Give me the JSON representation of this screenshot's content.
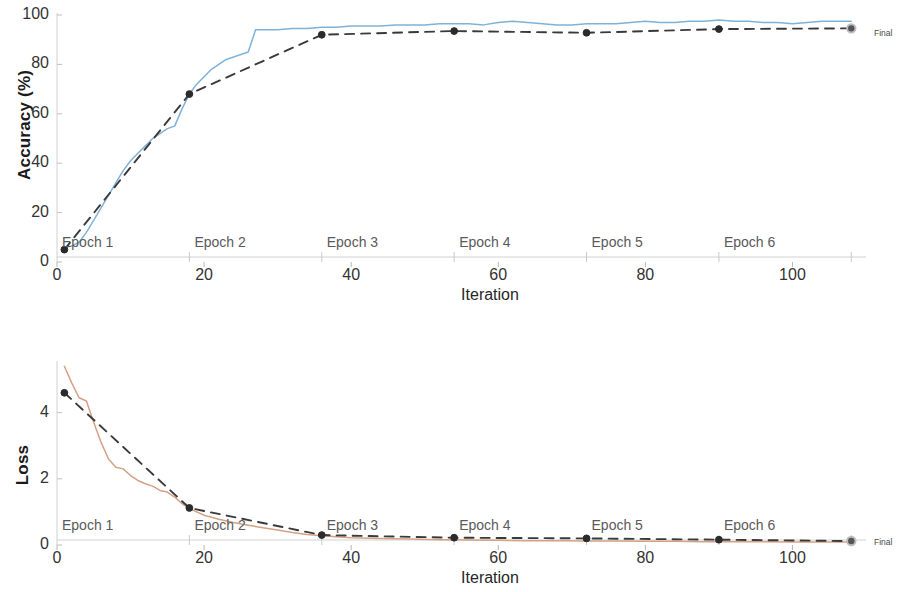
{
  "figure": {
    "background_color": "#ffffff",
    "final_label": "Final"
  },
  "accuracy_panel": {
    "name": "accuracy-plot",
    "ylabel": "Accuracy (%)",
    "xlabel": "Iteration",
    "yticks": [
      "0",
      "20",
      "40",
      "60",
      "80",
      "100"
    ],
    "xticks": [
      "0",
      "20",
      "40",
      "60",
      "80",
      "100"
    ],
    "epochs": [
      "Epoch 1",
      "Epoch 2",
      "Epoch 3",
      "Epoch 4",
      "Epoch 5",
      "Epoch 6"
    ]
  },
  "loss_panel": {
    "name": "loss-plot",
    "ylabel": "Loss",
    "xlabel": "Iteration",
    "yticks": [
      "0",
      "2",
      "4"
    ],
    "xticks": [
      "0",
      "20",
      "40",
      "60",
      "80",
      "100"
    ],
    "epochs": [
      "Epoch 1",
      "Epoch 2",
      "Epoch 3",
      "Epoch 4",
      "Epoch 5",
      "Epoch 6"
    ]
  },
  "chart_data": [
    {
      "type": "line",
      "title": "",
      "xlabel": "Iteration",
      "ylabel": "Accuracy (%)",
      "xlim": [
        0,
        110
      ],
      "ylim": [
        0,
        100
      ],
      "xticks": [
        0,
        20,
        40,
        60,
        80,
        100
      ],
      "yticks": [
        0,
        20,
        40,
        60,
        80,
        100
      ],
      "grid": false,
      "legend": false,
      "epoch_boundaries": [
        18,
        36,
        54,
        72,
        90,
        108
      ],
      "epoch_labels": [
        "Epoch 1",
        "Epoch 2",
        "Epoch 3",
        "Epoch 4",
        "Epoch 5",
        "Epoch 6"
      ],
      "series": [
        {
          "name": "Training accuracy",
          "color": "#7FB2D9",
          "style": "solid",
          "x": [
            1,
            2,
            3,
            4,
            5,
            6,
            7,
            8,
            9,
            10,
            11,
            12,
            13,
            14,
            15,
            16,
            17,
            18,
            19,
            20,
            21,
            22,
            23,
            24,
            25,
            26,
            27,
            28,
            29,
            30,
            32,
            34,
            36,
            38,
            40,
            42,
            44,
            46,
            48,
            50,
            52,
            54,
            56,
            58,
            60,
            62,
            64,
            66,
            68,
            70,
            72,
            74,
            76,
            78,
            80,
            82,
            84,
            86,
            88,
            90,
            92,
            94,
            96,
            98,
            100,
            102,
            104,
            106,
            108
          ],
          "y": [
            6,
            6.5,
            8,
            12,
            17,
            22,
            27,
            32,
            37,
            41,
            44,
            47,
            50,
            52,
            54,
            55,
            62,
            68,
            72,
            75,
            78,
            80,
            82,
            83,
            84,
            85,
            94,
            94,
            94,
            94,
            94.5,
            94.5,
            95,
            95,
            95.5,
            95.5,
            95.5,
            96,
            96,
            96,
            96.5,
            96.5,
            96.5,
            96,
            97,
            97.5,
            97,
            96.5,
            96,
            96,
            96.5,
            96.5,
            96.5,
            97,
            97.5,
            97,
            97,
            97.5,
            97.5,
            98,
            97.5,
            97.5,
            97,
            97,
            96.5,
            97,
            97.5,
            97.5,
            97.5
          ]
        },
        {
          "name": "Validation accuracy",
          "color": "#3A3A3A",
          "style": "dashed",
          "x": [
            1,
            18,
            36,
            54,
            72,
            90,
            108
          ],
          "y": [
            5,
            68,
            92,
            93.5,
            92.8,
            94.3,
            94.6
          ]
        }
      ],
      "markers": [
        {
          "x": 1,
          "y": 5
        },
        {
          "x": 18,
          "y": 68
        },
        {
          "x": 36,
          "y": 92
        },
        {
          "x": 54,
          "y": 93.5
        },
        {
          "x": 72,
          "y": 92.8
        },
        {
          "x": 90,
          "y": 94.3
        },
        {
          "x": 108,
          "y": 94.6
        }
      ],
      "final_marker": {
        "x": 108,
        "y": 94.6,
        "label": "Final"
      }
    },
    {
      "type": "line",
      "title": "",
      "xlabel": "Iteration",
      "ylabel": "Loss",
      "xlim": [
        0,
        110
      ],
      "ylim": [
        0,
        5.5
      ],
      "xticks": [
        0,
        20,
        40,
        60,
        80,
        100
      ],
      "yticks": [
        0,
        2,
        4
      ],
      "grid": false,
      "legend": false,
      "epoch_boundaries": [
        18,
        36,
        54,
        72,
        90,
        108
      ],
      "epoch_labels": [
        "Epoch 1",
        "Epoch 2",
        "Epoch 3",
        "Epoch 4",
        "Epoch 5",
        "Epoch 6"
      ],
      "series": [
        {
          "name": "Training loss",
          "color": "#D5A184",
          "style": "solid",
          "x": [
            1,
            2,
            3,
            4,
            5,
            6,
            7,
            8,
            9,
            10,
            11,
            12,
            13,
            14,
            15,
            16,
            17,
            18,
            19,
            20,
            22,
            24,
            26,
            28,
            30,
            32,
            34,
            36,
            38,
            40,
            44,
            48,
            52,
            56,
            60,
            64,
            68,
            72,
            76,
            80,
            84,
            88,
            92,
            96,
            100,
            104,
            108
          ],
          "y": [
            5.4,
            4.9,
            4.45,
            4.35,
            3.7,
            3.1,
            2.6,
            2.35,
            2.3,
            2.1,
            1.95,
            1.85,
            1.78,
            1.65,
            1.6,
            1.45,
            1.25,
            1.1,
            1.0,
            0.9,
            0.78,
            0.68,
            0.6,
            0.52,
            0.45,
            0.38,
            0.32,
            0.28,
            0.25,
            0.22,
            0.2,
            0.18,
            0.16,
            0.15,
            0.14,
            0.13,
            0.13,
            0.12,
            0.12,
            0.11,
            0.11,
            0.1,
            0.1,
            0.1,
            0.09,
            0.09,
            0.09
          ]
        },
        {
          "name": "Validation loss",
          "color": "#3A3A3A",
          "style": "dashed",
          "x": [
            1,
            18,
            36,
            54,
            72,
            90,
            108
          ],
          "y": [
            4.6,
            1.12,
            0.3,
            0.22,
            0.2,
            0.16,
            0.12
          ]
        }
      ],
      "markers": [
        {
          "x": 1,
          "y": 4.6
        },
        {
          "x": 18,
          "y": 1.12
        },
        {
          "x": 36,
          "y": 0.3
        },
        {
          "x": 54,
          "y": 0.22
        },
        {
          "x": 72,
          "y": 0.2
        },
        {
          "x": 90,
          "y": 0.16
        },
        {
          "x": 108,
          "y": 0.12
        }
      ],
      "final_marker": {
        "x": 108,
        "y": 0.12,
        "label": "Final"
      }
    }
  ]
}
